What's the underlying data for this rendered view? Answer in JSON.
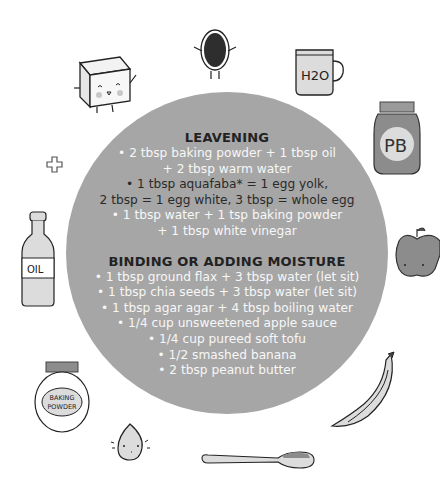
{
  "sections": [
    {
      "title": "LEAVENING",
      "lines": [
        {
          "text": "• 2 tbsp baking powder + 1 tbsp oil",
          "tone": "white"
        },
        {
          "text": "+ 2 tbsp warm water",
          "tone": "white"
        },
        {
          "text": "• 1 tbsp aquafaba* = 1 egg yolk,",
          "tone": "dark"
        },
        {
          "text": "2 tbsp = 1 egg white, 3 tbsp = whole egg",
          "tone": "dark"
        },
        {
          "text": "• 1 tbsp water + 1 tsp baking powder",
          "tone": "white"
        },
        {
          "text": "+ 1 tbsp white vinegar",
          "tone": "white"
        }
      ]
    },
    {
      "title": "BINDING OR ADDING MOISTURE",
      "lines": [
        {
          "text": "• 1 tbsp ground flax + 3 tbsp water (let sit)",
          "tone": "white"
        },
        {
          "text": "• 1 tbsp chia seeds + 3 tbsp water (let sit)",
          "tone": "white"
        },
        {
          "text": "• 1 tbsp agar agar + 4 tbsp boiling water",
          "tone": "white"
        },
        {
          "text": "• 1/4 cup unsweetened apple sauce",
          "tone": "white"
        },
        {
          "text": "• 1/4 cup pureed soft tofu",
          "tone": "white"
        },
        {
          "text": "• 1/2 smashed banana",
          "tone": "white"
        },
        {
          "text": "• 2 tbsp peanut butter",
          "tone": "white"
        }
      ]
    }
  ],
  "illustrations": {
    "mug_label": "H2O",
    "jar_label": "PB",
    "bottle_label": "OIL",
    "powder_label_1": "BAKING",
    "powder_label_2": "POWDER"
  },
  "colors": {
    "circle": "#a6a6a6",
    "heading": "#222222",
    "text_light": "#f7f7f7",
    "text_dark": "#2a2a2a",
    "illustration_fill": "#dcdcdc",
    "illustration_dark": "#7a7a7a"
  }
}
